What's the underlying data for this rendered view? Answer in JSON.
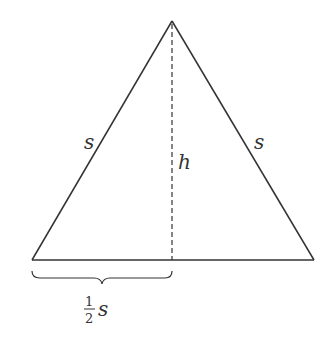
{
  "diagram": {
    "type": "equilateral-triangle-height",
    "colors": {
      "stroke": "#333333",
      "background": "#ffffff"
    },
    "vertices": {
      "apex": [
        172,
        21
      ],
      "bottom_left": [
        32,
        260
      ],
      "bottom_right": [
        314,
        260
      ]
    },
    "labels": {
      "left_side": "s",
      "right_side": "s",
      "height": "h",
      "half_base_numerator": "1",
      "half_base_denominator": "2",
      "half_base_variable": "s"
    }
  }
}
